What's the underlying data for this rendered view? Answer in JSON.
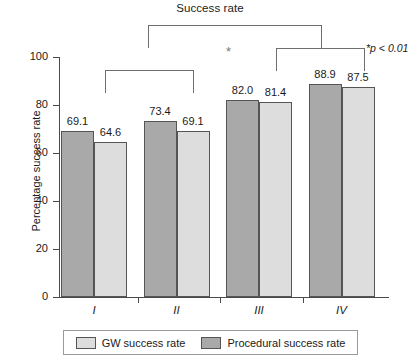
{
  "chart_data": {
    "type": "bar",
    "title": "Success rate",
    "xlabel": "",
    "ylabel": "Percentage success rate",
    "categories": [
      "I",
      "II",
      "III",
      "IV"
    ],
    "ylim": [
      0,
      100
    ],
    "yticks": [
      0,
      20,
      40,
      60,
      80,
      100
    ],
    "grid": false,
    "legend_position": "bottom",
    "series": [
      {
        "name": "Procedural success rate",
        "color": "#a9a9a9",
        "values": [
          69.1,
          73.4,
          82.0,
          88.9
        ],
        "labels": [
          "69.1",
          "73.4",
          "82.0",
          "88.9"
        ]
      },
      {
        "name": "GW success rate",
        "color": "#dddddd",
        "values": [
          64.6,
          69.1,
          81.4,
          87.5
        ],
        "labels": [
          "64.6",
          "69.1",
          "81.4",
          "87.5"
        ]
      }
    ],
    "annotations": {
      "pvalue_note": "*p < 0.01",
      "significance_marker": "*",
      "brackets": [
        {
          "name": "outer",
          "from": "group-I-II",
          "to": "group-IV"
        },
        {
          "name": "inner-left",
          "from": "I",
          "to": "II"
        },
        {
          "name": "inner-right",
          "from": "III",
          "to": "IV"
        }
      ]
    },
    "ytick_labels": [
      "0",
      "20",
      "40",
      "60",
      "80",
      "100"
    ]
  },
  "legend": {
    "items": [
      {
        "label": "GW success rate",
        "swatch": "light"
      },
      {
        "label": "Procedural success rate",
        "swatch": "dark"
      }
    ]
  }
}
